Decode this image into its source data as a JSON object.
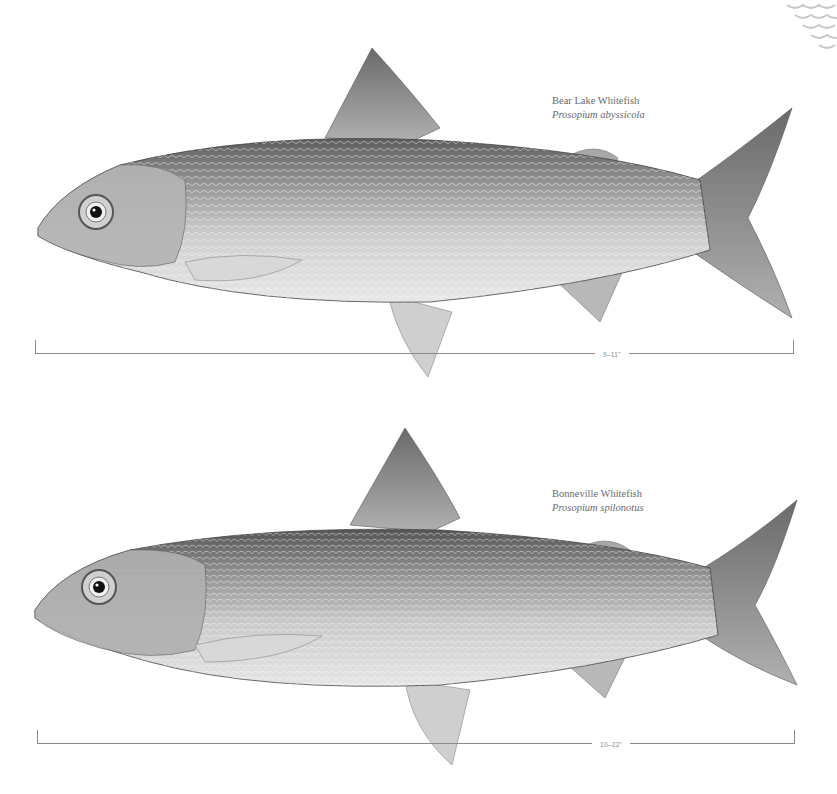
{
  "plates": [
    {
      "common_name": "Bear Lake Whitefish",
      "scientific_name": "Prosopium abyssicola",
      "size_range": "9–11\""
    },
    {
      "common_name": "Bonneville Whitefish",
      "scientific_name": "Prosopium spilonotus",
      "size_range": "10–22\""
    }
  ],
  "colors": {
    "label_text": "#6a6a6a",
    "scale_line": "#8a8a8a",
    "background": "#ffffff"
  }
}
